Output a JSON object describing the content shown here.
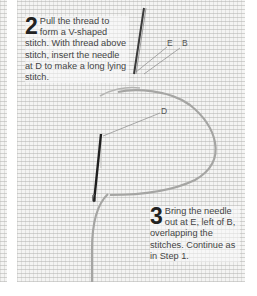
{
  "illustration": {
    "subject": "embroidery long-stitch on aida fabric",
    "fabric_color": "#f4f4f3",
    "thread_color": "#9a9a98",
    "needle_color": "#2a2a2a"
  },
  "step2": {
    "number": "2",
    "text": "Pull the thread to form a V-shaped stitch. With thread above stitch, insert the needle at D to make a long lying stitch."
  },
  "step3": {
    "number": "3",
    "text": "Bring the needle out at E, left of B, overlapping the stitches. Continue as in Step 1."
  },
  "labels": {
    "e": "E",
    "b": "B",
    "d": "D"
  }
}
